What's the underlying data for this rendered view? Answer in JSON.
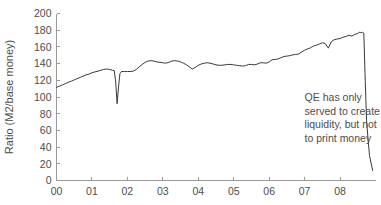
{
  "chart_data": {
    "type": "line",
    "title": "",
    "xlabel": "",
    "ylabel": "Ratio (M2/base money)",
    "xlim": [
      2000.0,
      2009.0
    ],
    "ylim": [
      0,
      200
    ],
    "grid": false,
    "legend": null,
    "xtick_labels": [
      "00",
      "01",
      "02",
      "03",
      "04",
      "05",
      "06",
      "07",
      "08"
    ],
    "xtick_values": [
      2000,
      2001,
      2002,
      2003,
      2004,
      2005,
      2006,
      2007,
      2008
    ],
    "ytick_labels": [
      "0",
      "20",
      "40",
      "60",
      "80",
      "100",
      "120",
      "140",
      "160",
      "180",
      "200"
    ],
    "ytick_values": [
      0,
      20,
      40,
      60,
      80,
      100,
      120,
      140,
      160,
      180,
      200
    ],
    "series": [
      {
        "name": "M2 to base money ratio",
        "color": "#3a3a3a",
        "x": [
          2000.0,
          2000.08,
          2000.17,
          2000.25,
          2000.33,
          2000.42,
          2000.5,
          2000.58,
          2000.67,
          2000.75,
          2000.83,
          2000.92,
          2001.0,
          2001.08,
          2001.17,
          2001.25,
          2001.33,
          2001.42,
          2001.5,
          2001.58,
          2001.63,
          2001.67,
          2001.71,
          2001.75,
          2001.79,
          2001.83,
          2001.92,
          2002.0,
          2002.08,
          2002.17,
          2002.25,
          2002.33,
          2002.42,
          2002.5,
          2002.58,
          2002.67,
          2002.75,
          2002.83,
          2002.92,
          2003.0,
          2003.08,
          2003.17,
          2003.25,
          2003.33,
          2003.42,
          2003.5,
          2003.58,
          2003.67,
          2003.75,
          2003.83,
          2003.92,
          2004.0,
          2004.08,
          2004.17,
          2004.25,
          2004.33,
          2004.42,
          2004.5,
          2004.58,
          2004.67,
          2004.75,
          2004.83,
          2004.92,
          2005.0,
          2005.08,
          2005.17,
          2005.25,
          2005.33,
          2005.42,
          2005.5,
          2005.58,
          2005.67,
          2005.75,
          2005.83,
          2005.92,
          2006.0,
          2006.08,
          2006.17,
          2006.25,
          2006.33,
          2006.42,
          2006.5,
          2006.58,
          2006.67,
          2006.75,
          2006.83,
          2006.92,
          2007.0,
          2007.08,
          2007.17,
          2007.25,
          2007.33,
          2007.42,
          2007.5,
          2007.58,
          2007.67,
          2007.75,
          2007.83,
          2007.92,
          2008.0,
          2008.08,
          2008.17,
          2008.25,
          2008.33,
          2008.42,
          2008.5,
          2008.54,
          2008.58,
          2008.63,
          2008.67,
          2008.71,
          2008.75,
          2008.83,
          2008.92
        ],
        "y": [
          111.5,
          113.0,
          114.5,
          116.0,
          117.5,
          119.0,
          120.5,
          122.0,
          123.5,
          125.0,
          126.5,
          127.5,
          129.0,
          130.0,
          131.0,
          132.0,
          133.0,
          133.5,
          133.0,
          132.0,
          131.5,
          118.0,
          92.0,
          112.0,
          128.0,
          130.5,
          130.5,
          130.5,
          130.5,
          131.0,
          133.0,
          136.0,
          139.0,
          141.5,
          143.0,
          143.5,
          143.0,
          142.0,
          141.5,
          141.0,
          140.5,
          141.5,
          143.0,
          143.5,
          143.0,
          142.0,
          140.5,
          138.5,
          136.0,
          133.5,
          135.5,
          138.0,
          139.5,
          140.5,
          141.0,
          140.5,
          139.5,
          138.5,
          138.0,
          138.0,
          138.5,
          139.0,
          139.0,
          138.5,
          138.0,
          137.5,
          137.0,
          137.5,
          139.0,
          139.0,
          138.5,
          139.5,
          141.0,
          141.0,
          140.5,
          142.0,
          144.5,
          145.0,
          145.5,
          147.0,
          148.5,
          149.0,
          149.5,
          150.5,
          151.0,
          151.5,
          154.0,
          156.0,
          157.5,
          159.0,
          161.0,
          162.0,
          163.5,
          165.0,
          164.0,
          158.5,
          166.0,
          168.5,
          169.5,
          170.0,
          171.5,
          172.5,
          174.0,
          173.0,
          175.0,
          176.0,
          177.5,
          177.0,
          177.5,
          176.5,
          120.0,
          70.0,
          30.0,
          12.0
        ]
      }
    ],
    "annotations": [
      {
        "name": "qe-annotation",
        "lines": [
          "QE has only",
          "served to create",
          "liquidity, but not",
          "to print money"
        ],
        "x": 2007.0,
        "y": 95
      }
    ]
  },
  "axis": {
    "ylabel": "Ratio (M2/base money)"
  }
}
